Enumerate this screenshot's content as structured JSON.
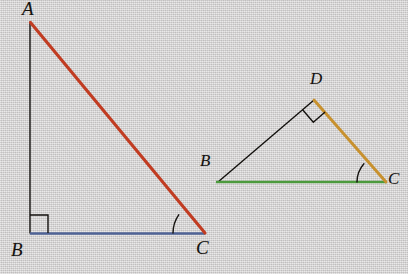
{
  "figure": {
    "background_color": "#d5d3d3",
    "width": 408,
    "height": 274,
    "ink_color": "#14120f"
  },
  "colors": {
    "red": "#c13c22",
    "blue": "#4f6396",
    "green": "#4c9a3d",
    "gold": "#c8912e",
    "black": "#14120f"
  },
  "triangle_abc": {
    "name": "triangle-abc",
    "vertices": {
      "A": {
        "label": "A",
        "x": 30,
        "y": 22,
        "label_x": 22,
        "label_y": 1
      },
      "B": {
        "label": "B",
        "x": 30,
        "y": 233,
        "label_x": 12,
        "label_y": 245
      },
      "C": {
        "label": "C",
        "x": 204,
        "y": 233,
        "label_x": 195,
        "label_y": 243
      }
    },
    "sides": [
      {
        "name": "side-ab",
        "from": "A",
        "to": "B",
        "color": "#14120f",
        "width": 1.4,
        "style": "thin-black"
      },
      {
        "name": "side-bc",
        "from": "B",
        "to": "C",
        "color": "#4f6396",
        "width": 2.2,
        "style": "blue-base"
      },
      {
        "name": "side-ac",
        "from": "A",
        "to": "C",
        "color": "#c13c22",
        "width": 3.0,
        "style": "red-hypotenuse"
      }
    ],
    "right_angle": {
      "at": "B",
      "size": 18,
      "marker": "square"
    },
    "angle_arc": {
      "at": "C",
      "radius": 32,
      "marker": "arc"
    }
  },
  "triangle_bdc": {
    "name": "triangle-bdc",
    "vertices": {
      "B": {
        "label": "B",
        "x": 218,
        "y": 182,
        "label_x": 199,
        "label_y": 159
      },
      "D": {
        "label": "D",
        "x": 314,
        "y": 100,
        "label_x": 310,
        "label_y": 74
      },
      "C": {
        "label": "C",
        "x": 385,
        "y": 182,
        "label_x": 388,
        "label_y": 175
      }
    },
    "sides": [
      {
        "name": "side-bd",
        "from": "B",
        "to": "D",
        "color": "#14120f",
        "width": 1.4,
        "style": "thin-black"
      },
      {
        "name": "side-bc",
        "from": "B",
        "to": "C",
        "color": "#4c9a3d",
        "width": 2.4,
        "style": "green-base"
      },
      {
        "name": "side-dc",
        "from": "D",
        "to": "C",
        "color": "#c8912e",
        "width": 2.8,
        "style": "gold-side"
      }
    ],
    "right_angle": {
      "at": "D",
      "size": 15,
      "marker": "square-rotated"
    },
    "angle_arc": {
      "at": "C",
      "radius": 30,
      "marker": "arc"
    }
  }
}
